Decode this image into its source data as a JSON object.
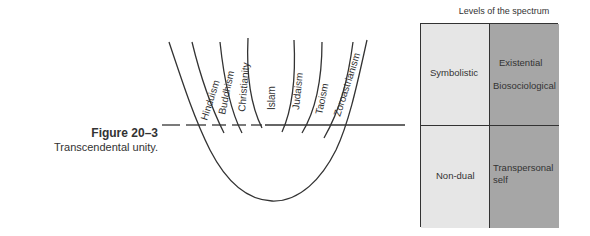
{
  "figure": {
    "number": "Figure 20–3",
    "title": "Transcendental unity."
  },
  "diagram": {
    "religions": [
      "Hinduism",
      "Buddhism",
      "Christianity",
      "Islam",
      "Judaism",
      "Taoism",
      "Zoroastrianism"
    ]
  },
  "spectrum": {
    "title": "Levels of the spectrum",
    "cells": {
      "top_left": "Symbolistic",
      "top_right_1": "Existential",
      "top_right_2": "Biosociological",
      "bottom_left": "Non-dual",
      "bottom_right_1": "Transpersonal",
      "bottom_right_2": "self"
    },
    "colors": {
      "light": "#e6e6e6",
      "dark": "#a6a6a6",
      "border": "#333333"
    }
  }
}
